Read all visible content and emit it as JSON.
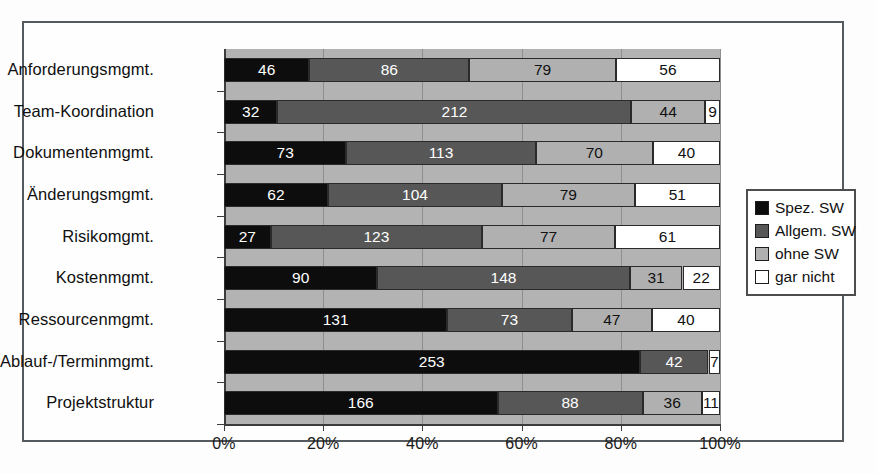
{
  "chart_data": {
    "type": "bar",
    "orientation": "horizontal",
    "stacked": true,
    "normalized": true,
    "title": "",
    "xlabel": "",
    "ylabel": "",
    "xlim": [
      0,
      100
    ],
    "xticks": [
      "0%",
      "20%",
      "40%",
      "60%",
      "80%",
      "100%"
    ],
    "xtick_values": [
      0,
      20,
      40,
      60,
      80,
      100
    ],
    "grid": true,
    "legend_position": "right",
    "categories": [
      "Anforderungsmgmt.",
      "Team-Koordination",
      "Dokumentenmgmt.",
      "Änderungsmgmt.",
      "Risikomgmt.",
      "Kostenmgmt.",
      "Ressourcenmgmt.",
      "Ablauf-/Terminmgmt.",
      "Projektstruktur"
    ],
    "series": [
      {
        "name": "Spez. SW",
        "color": "#0d0d0d",
        "values": [
          46,
          32,
          73,
          62,
          27,
          90,
          131,
          253,
          166
        ]
      },
      {
        "name": "Allgem. SW",
        "color": "#575757",
        "values": [
          86,
          212,
          113,
          104,
          123,
          148,
          73,
          42,
          88
        ]
      },
      {
        "name": "ohne SW",
        "color": "#b0b0b0",
        "values": [
          79,
          44,
          70,
          79,
          77,
          31,
          47,
          0,
          36
        ]
      },
      {
        "name": "gar nicht",
        "color": "#ffffff",
        "values": [
          56,
          9,
          40,
          51,
          61,
          22,
          40,
          7,
          11
        ]
      }
    ],
    "rows": [
      {
        "category": "Anforderungsmgmt.",
        "values": [
          46,
          86,
          79,
          56
        ],
        "total": 267
      },
      {
        "category": "Team-Koordination",
        "values": [
          32,
          212,
          44,
          9
        ],
        "total": 297
      },
      {
        "category": "Dokumentenmgmt.",
        "values": [
          73,
          113,
          70,
          40
        ],
        "total": 296
      },
      {
        "category": "Änderungsmgmt.",
        "values": [
          62,
          104,
          79,
          51
        ],
        "total": 296
      },
      {
        "category": "Risikomgmt.",
        "values": [
          27,
          123,
          77,
          61
        ],
        "total": 288
      },
      {
        "category": "Kostenmgmt.",
        "values": [
          90,
          148,
          31,
          22
        ],
        "total": 291
      },
      {
        "category": "Ressourcenmgmt.",
        "values": [
          131,
          73,
          47,
          40
        ],
        "total": 291
      },
      {
        "category": "Ablauf-/Terminmgmt.",
        "values": [
          253,
          42,
          0,
          7
        ],
        "total": 302
      },
      {
        "category": "Projektstruktur",
        "values": [
          166,
          88,
          36,
          11
        ],
        "total": 301
      }
    ]
  },
  "legend": {
    "items": [
      {
        "label": "Spez. SW",
        "color": "#0d0d0d"
      },
      {
        "label": "Allgem. SW",
        "color": "#575757"
      },
      {
        "label": "ohne SW",
        "color": "#b0b0b0"
      },
      {
        "label": "gar nicht",
        "color": "#ffffff"
      }
    ]
  },
  "colors": {
    "plot_background": "#b3b3b3",
    "frame_border": "#555a5e",
    "axis": "#3c3c3c",
    "gridline": "#8e8e8e",
    "page_background": "#fdfdfd"
  }
}
